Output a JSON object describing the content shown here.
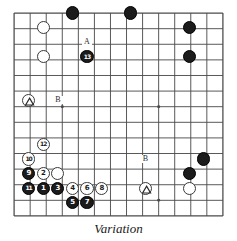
{
  "figure": {
    "caption": "Variation",
    "board": {
      "type": "go-board-diagram",
      "cols": 14,
      "rows": 14,
      "cell": 14.6,
      "star_points": [
        {
          "col": 3,
          "row": 6
        },
        {
          "col": 9,
          "row": 6
        },
        {
          "col": 9,
          "row": 12
        }
      ]
    },
    "stones": [
      {
        "id": "w-a1",
        "color": "white",
        "col": 2,
        "row": 1,
        "label": "",
        "marker": ""
      },
      {
        "id": "w-a2",
        "color": "white",
        "col": 2,
        "row": 3,
        "label": "",
        "marker": ""
      },
      {
        "id": "b-top1",
        "color": "black",
        "col": 4,
        "row": 0,
        "label": "",
        "marker": ""
      },
      {
        "id": "b-top2",
        "color": "black",
        "col": 8,
        "row": 0,
        "label": "",
        "marker": ""
      },
      {
        "id": "b-r1",
        "color": "black",
        "col": 12,
        "row": 1,
        "label": "",
        "marker": ""
      },
      {
        "id": "b-r2",
        "color": "black",
        "col": 12,
        "row": 3,
        "label": "",
        "marker": ""
      },
      {
        "id": "b-13",
        "color": "black",
        "col": 5,
        "row": 3,
        "label": "13",
        "marker": ""
      },
      {
        "id": "w-tri-left",
        "color": "white",
        "col": 1,
        "row": 6,
        "label": "",
        "marker": "triangle"
      },
      {
        "id": "w-12",
        "color": "white",
        "col": 2,
        "row": 9,
        "label": "12",
        "marker": ""
      },
      {
        "id": "w-10",
        "color": "white",
        "col": 1,
        "row": 10,
        "label": "10",
        "marker": ""
      },
      {
        "id": "b-9",
        "color": "black",
        "col": 1,
        "row": 11,
        "label": "9",
        "marker": ""
      },
      {
        "id": "w-2",
        "color": "white",
        "col": 2,
        "row": 11,
        "label": "2",
        "marker": ""
      },
      {
        "id": "w-plain-a",
        "color": "white",
        "col": 3,
        "row": 11,
        "label": "",
        "marker": ""
      },
      {
        "id": "b-11",
        "color": "black",
        "col": 1,
        "row": 12,
        "label": "11",
        "marker": ""
      },
      {
        "id": "b-1",
        "color": "black",
        "col": 2,
        "row": 12,
        "label": "1",
        "marker": ""
      },
      {
        "id": "b-3",
        "color": "black",
        "col": 3,
        "row": 12,
        "label": "3",
        "marker": ""
      },
      {
        "id": "w-4",
        "color": "white",
        "col": 4,
        "row": 12,
        "label": "4",
        "marker": ""
      },
      {
        "id": "w-6",
        "color": "white",
        "col": 5,
        "row": 12,
        "label": "6",
        "marker": ""
      },
      {
        "id": "w-8",
        "color": "white",
        "col": 6,
        "row": 12,
        "label": "8",
        "marker": ""
      },
      {
        "id": "b-5",
        "color": "black",
        "col": 4,
        "row": 13,
        "label": "5",
        "marker": ""
      },
      {
        "id": "b-7",
        "color": "black",
        "col": 5,
        "row": 13,
        "label": "7",
        "marker": ""
      },
      {
        "id": "w-tri-bottom",
        "color": "white",
        "col": 9,
        "row": 12,
        "label": "",
        "marker": "triangle"
      },
      {
        "id": "w-plain-b",
        "color": "white",
        "col": 12,
        "row": 12,
        "label": "",
        "marker": ""
      },
      {
        "id": "b-br1",
        "color": "black",
        "col": 13,
        "row": 10,
        "label": "",
        "marker": ""
      },
      {
        "id": "b-br2",
        "color": "black",
        "col": 12,
        "row": 11,
        "label": "",
        "marker": ""
      }
    ],
    "point_labels": [
      {
        "id": "label-a",
        "text": "A",
        "col": 5,
        "row": 2
      },
      {
        "id": "label-b-upper",
        "text": "B",
        "col": 3,
        "row": 6
      },
      {
        "id": "label-b-lower",
        "text": "B",
        "col": 9,
        "row": 10
      }
    ],
    "colors": {
      "black_stone": "#1b1b1b",
      "white_stone": "#ffffff",
      "stone_outline": "#3a3a3a",
      "grid_line": "#4a4a4a",
      "board_background": "#ffffff",
      "caption_text": "#1a1a1a"
    }
  }
}
